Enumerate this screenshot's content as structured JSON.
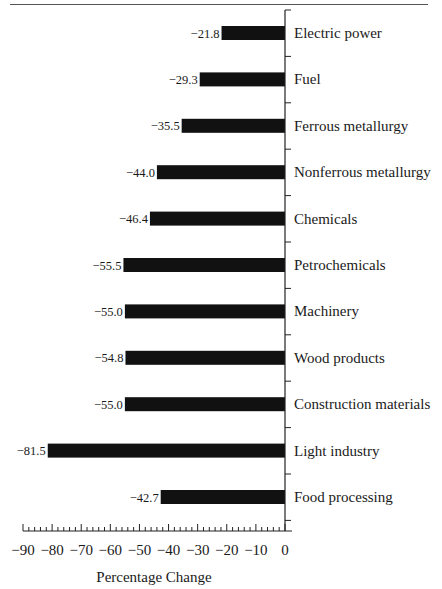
{
  "chart_data": {
    "type": "bar",
    "orientation": "horizontal",
    "title": "",
    "xlabel": "Percentage Change",
    "ylabel": "",
    "xlim": [
      -90,
      0
    ],
    "x_ticks": [
      -90,
      -80,
      -70,
      -60,
      -50,
      -40,
      -30,
      -20,
      -10,
      0
    ],
    "x_minor_step": 2,
    "grid": false,
    "legend": null,
    "bar_color": "#111111",
    "categories": [
      "Electric power",
      "Fuel",
      "Ferrous metallurgy",
      "Nonferrous metallurgy",
      "Chemicals",
      "Petrochemicals",
      "Machinery",
      "Wood products",
      "Construction materials",
      "Light industry",
      "Food processing"
    ],
    "values": [
      -21.8,
      -29.3,
      -35.5,
      -44.0,
      -46.4,
      -55.5,
      -55.0,
      -54.8,
      -55.0,
      -81.5,
      -42.7
    ],
    "value_labels": [
      "-21.8",
      "-29.3",
      "-35.5",
      "-44.0",
      "-46.4",
      "-55.5",
      "-55.0",
      "-54.8",
      "-55.0",
      "-81.5",
      "-42.7"
    ]
  }
}
